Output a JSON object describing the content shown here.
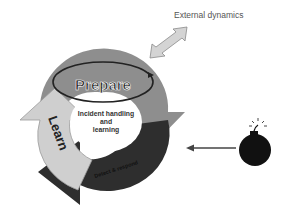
{
  "diagram": {
    "external_label": "External dynamics",
    "center_label_lines": [
      "Incident handling",
      "and",
      "learning"
    ],
    "segments": {
      "prepare": "Prepare",
      "learn": "Learn",
      "detect": "Detect & respond"
    },
    "colors": {
      "prepare": "#8e8e8e",
      "learn": "#cfcfcf",
      "detect": "#2e2e2e",
      "external_arrow": "#d4d4d4",
      "bomb": "#111111",
      "incoming_arrow": "#444444"
    },
    "icons": [
      "double-arrow-icon",
      "bomb-icon",
      "incoming-arrow-icon",
      "cycle-loop-icon"
    ]
  }
}
